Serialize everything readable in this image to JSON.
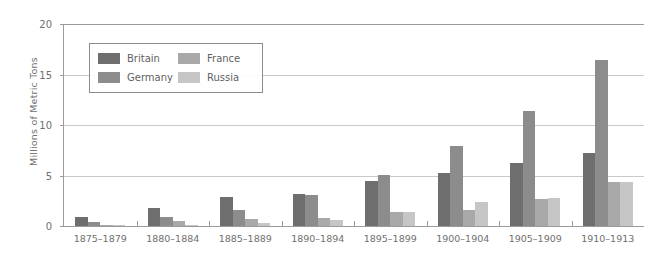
{
  "chart_data": {
    "type": "bar",
    "title": "",
    "xlabel": "",
    "ylabel": "Millions of Metric Tons",
    "ylim": [
      0,
      20
    ],
    "yticks": [
      0,
      5,
      10,
      15,
      20
    ],
    "grid": true,
    "legend_position": "inside-top-left",
    "categories": [
      "1875–1879",
      "1880–1884",
      "1885–1889",
      "1890–1894",
      "1895–1899",
      "1900–1904",
      "1905–1909",
      "1910–1913"
    ],
    "series": [
      {
        "name": "Britain",
        "color": "#6e6e6e",
        "values": [
          0.9,
          1.8,
          2.9,
          3.2,
          4.5,
          5.2,
          6.2,
          7.2
        ]
      },
      {
        "name": "Germany",
        "color": "#8c8c8c",
        "values": [
          0.35,
          0.9,
          1.6,
          3.1,
          5.1,
          7.9,
          11.4,
          16.4
        ]
      },
      {
        "name": "France",
        "color": "#a9a9a9",
        "values": [
          0.1,
          0.45,
          0.7,
          0.8,
          1.4,
          1.6,
          2.7,
          4.4
        ]
      },
      {
        "name": "Russia",
        "color": "#c6c6c6",
        "values": [
          0.05,
          0.15,
          0.25,
          0.6,
          1.4,
          2.4,
          2.8,
          4.4
        ]
      }
    ]
  },
  "axis": {
    "y_title": "Millions of Metric Tons",
    "y_tick_labels": [
      "0",
      "5",
      "10",
      "15",
      "20"
    ]
  },
  "legend": {
    "entries": [
      {
        "label": "Britain",
        "color": "#6e6e6e"
      },
      {
        "label": "France",
        "color": "#a9a9a9"
      },
      {
        "label": "Germany",
        "color": "#8c8c8c"
      },
      {
        "label": "Russia",
        "color": "#c6c6c6"
      }
    ]
  }
}
